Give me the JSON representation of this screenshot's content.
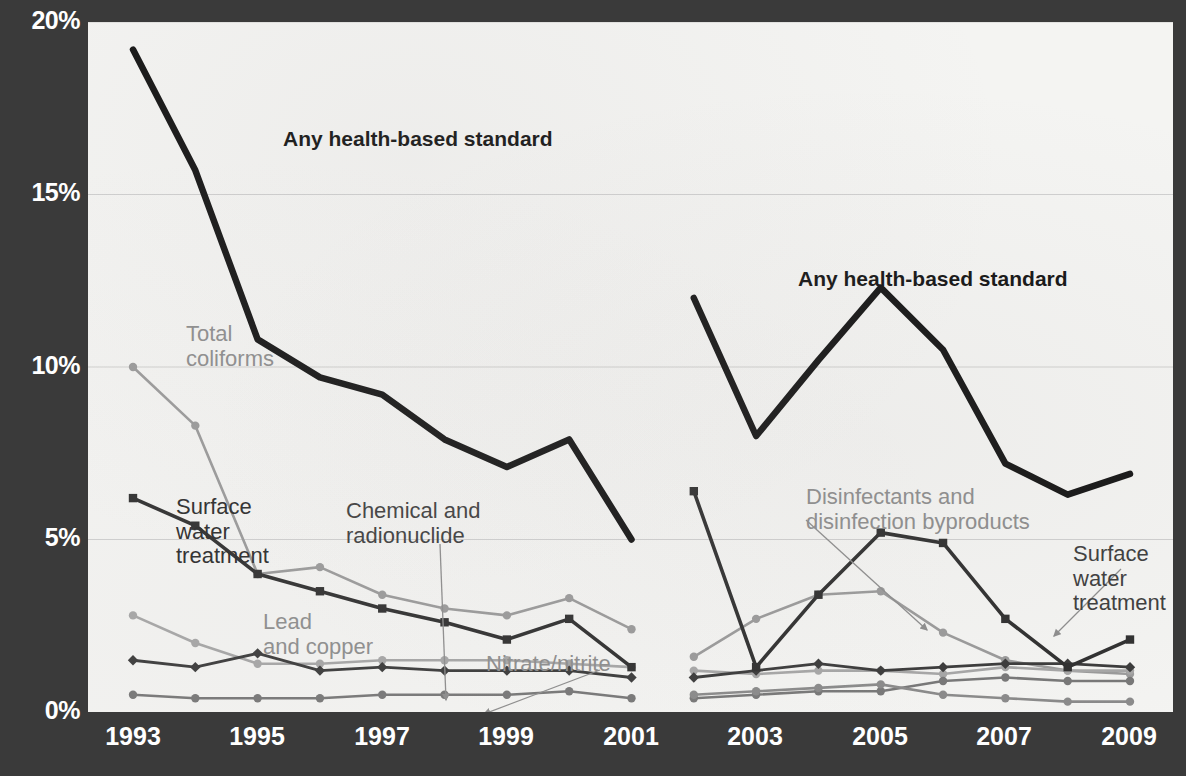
{
  "chart_data": {
    "type": "line",
    "title": "",
    "xlabel": "",
    "ylabel": "",
    "ylim": [
      0,
      20
    ],
    "yticks": [
      "0%",
      "5%",
      "10%",
      "15%",
      "20%"
    ],
    "ytick_values": [
      0,
      5,
      10,
      15,
      20
    ],
    "grid": true,
    "legend_position": "inline-annotations",
    "x": [
      1993,
      1994,
      1995,
      1996,
      1997,
      1998,
      1999,
      2000,
      2001,
      2002,
      2003,
      2004,
      2005,
      2006,
      2007,
      2008,
      2009
    ],
    "xtick_labels": [
      "1993",
      "1995",
      "1997",
      "1999",
      "2001",
      "2003",
      "2005",
      "2007",
      "2009"
    ],
    "xtick_values": [
      1993,
      1995,
      1997,
      1999,
      2001,
      2003,
      2005,
      2007,
      2009
    ],
    "note": "Series are drawn as two separate runs: 1993-2001 and 2002-2009 (methodology break).",
    "series": [
      {
        "name": "Any health-based standard",
        "color": "#141414",
        "width": 6.5,
        "marker": "none",
        "segments": [
          {
            "x": [
              1993,
              1994,
              1995,
              1996,
              1997,
              1998,
              1999,
              2000,
              2001
            ],
            "values": [
              19.2,
              15.7,
              10.8,
              9.7,
              9.2,
              7.9,
              7.1,
              7.9,
              5.0
            ]
          },
          {
            "x": [
              2002,
              2003,
              2004,
              2005,
              2006,
              2007,
              2008,
              2009
            ],
            "values": [
              12.0,
              8.0,
              10.2,
              12.3,
              10.5,
              7.2,
              6.3,
              6.9
            ]
          }
        ]
      },
      {
        "name": "Total coliforms",
        "color": "#9a9a9a",
        "width": 2.6,
        "marker": "circle",
        "segments": [
          {
            "x": [
              1993,
              1994,
              1995,
              1996,
              1997,
              1998,
              1999,
              2000,
              2001
            ],
            "values": [
              10.0,
              8.3,
              4.0,
              4.2,
              3.4,
              3.0,
              2.8,
              3.3,
              2.4
            ]
          },
          {
            "x": [
              2002,
              2003,
              2004,
              2005,
              2006,
              2007,
              2008,
              2009
            ],
            "values": [
              1.6,
              2.7,
              3.4,
              3.5,
              2.3,
              1.5,
              1.2,
              1.1
            ]
          }
        ]
      },
      {
        "name": "Surface water treatment",
        "color": "#2f2f2f",
        "width": 3.6,
        "marker": "square",
        "segments": [
          {
            "x": [
              1993,
              1994,
              1995,
              1996,
              1997,
              1998,
              1999,
              2000,
              2001
            ],
            "values": [
              6.2,
              5.4,
              4.0,
              3.5,
              3.0,
              2.6,
              2.1,
              2.7,
              1.3
            ]
          },
          {
            "x": [
              2002,
              2003,
              2004,
              2005,
              2006,
              2007,
              2008,
              2009
            ],
            "values": [
              6.4,
              1.3,
              3.4,
              5.2,
              4.9,
              2.7,
              1.3,
              2.1
            ]
          }
        ]
      },
      {
        "name": "Lead and copper",
        "color": "#a6a6a6",
        "width": 2.6,
        "marker": "circle",
        "segments": [
          {
            "x": [
              1993,
              1994,
              1995,
              1996,
              1997,
              1998,
              1999,
              2000,
              2001
            ],
            "values": [
              2.8,
              2.0,
              1.4,
              1.4,
              1.5,
              1.5,
              1.5,
              1.4,
              1.3
            ]
          },
          {
            "x": [
              2002,
              2003,
              2004,
              2005,
              2006,
              2007,
              2008,
              2009
            ],
            "values": [
              1.2,
              1.1,
              1.2,
              1.2,
              1.1,
              1.3,
              1.2,
              1.2
            ]
          }
        ]
      },
      {
        "name": "Chemical and radionuclide",
        "color": "#3a3a3a",
        "width": 2.8,
        "marker": "diamond",
        "segments": [
          {
            "x": [
              1993,
              1994,
              1995,
              1996,
              1997,
              1998,
              1999,
              2000,
              2001
            ],
            "values": [
              1.5,
              1.3,
              1.7,
              1.2,
              1.3,
              1.2,
              1.2,
              1.2,
              1.0
            ]
          },
          {
            "x": [
              2002,
              2003,
              2004,
              2005,
              2006,
              2007,
              2008,
              2009
            ],
            "values": [
              1.0,
              1.2,
              1.4,
              1.2,
              1.3,
              1.4,
              1.4,
              1.3
            ]
          }
        ]
      },
      {
        "name": "Nitrate/nitrite",
        "color": "#777777",
        "width": 2.6,
        "marker": "circle",
        "segments": [
          {
            "x": [
              1993,
              1994,
              1995,
              1996,
              1997,
              1998,
              1999,
              2000,
              2001
            ],
            "values": [
              0.5,
              0.4,
              0.4,
              0.4,
              0.5,
              0.5,
              0.5,
              0.6,
              0.4
            ]
          },
          {
            "x": [
              2002,
              2003,
              2004,
              2005,
              2006,
              2007,
              2008,
              2009
            ],
            "values": [
              0.4,
              0.5,
              0.6,
              0.6,
              0.9,
              1.0,
              0.9,
              0.9
            ]
          }
        ]
      },
      {
        "name": "Disinfectants and disinfection byproducts",
        "color": "#8a8a8a",
        "width": 2.6,
        "marker": "circle",
        "segments": [
          {
            "x": [
              2002,
              2003,
              2004,
              2005,
              2006,
              2007,
              2008,
              2009
            ],
            "values": [
              0.5,
              0.6,
              0.7,
              0.8,
              0.5,
              0.4,
              0.3,
              0.3
            ]
          }
        ]
      }
    ],
    "annotations": [
      {
        "text": "Any health-based standard",
        "style": "bold",
        "x": 195,
        "y": 105
      },
      {
        "text": "Any health-based standard",
        "style": "bold",
        "x": 710,
        "y": 245
      },
      {
        "text": "Total\ncoliforms",
        "style": "grayish",
        "x": 98,
        "y": 300
      },
      {
        "text": "Surface\nwater\ntreatment",
        "style": "darker",
        "x": 88,
        "y": 473
      },
      {
        "text": "Chemical and\nradionuclide",
        "style": "dark",
        "x": 258,
        "y": 477
      },
      {
        "text": "Lead\nand copper",
        "style": "grayish",
        "x": 175,
        "y": 588
      },
      {
        "text": "Nitrate/nitrite",
        "style": "grayish",
        "x": 398,
        "y": 630
      },
      {
        "text": "Disinfectants and\ndisinfection byproducts",
        "style": "grayish",
        "x": 718,
        "y": 463
      },
      {
        "text": "Surface water\ntreatment",
        "style": "dark",
        "x": 985,
        "y": 520
      }
    ],
    "leader_arrows": [
      {
        "from": [
          352,
          522
        ],
        "to": [
          358,
          678
        ],
        "name": "chemical-radionuclide-leader"
      },
      {
        "from": [
          512,
          648
        ],
        "to": [
          396,
          692
        ],
        "name": "nitrate-nitrite-leader"
      },
      {
        "from": [
          718,
          498
        ],
        "to": [
          839,
          608
        ],
        "name": "disinfectants-leader"
      },
      {
        "from": [
          1033,
          547
        ],
        "to": [
          966,
          614
        ],
        "name": "surface-water-right-leader"
      }
    ]
  },
  "colors": {
    "background": "#3a3a3a",
    "plot_background": "#f4f4f2",
    "axis_text": "#ffffff",
    "gridline": "#c9c9c9",
    "accent_black": "#141414"
  }
}
